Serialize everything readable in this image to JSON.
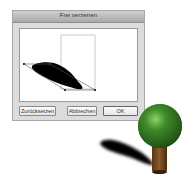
{
  "dialog": {
    "title": "Frei verzerren",
    "buttons": {
      "reset": "Zurücksetzen",
      "cancel": "Abbrechen",
      "ok": "OK"
    }
  },
  "illustration": {
    "tree_crown_color": "#3f8a2a",
    "tree_trunk_color": "#7a4a22",
    "shadow_color": "#000000"
  }
}
